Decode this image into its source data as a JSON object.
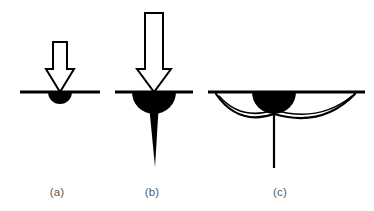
{
  "figure": {
    "background_color": "#ffffff",
    "ink_color": "#000000",
    "caption_color": "#58595b",
    "surface_line_label": "specimen-surface",
    "panel_count": 3
  },
  "panels": [
    {
      "id": "a",
      "caption": "(a)",
      "caption_x": 57,
      "caption_y": 196,
      "description": "Small indenter load producing a shallow plastic deformation zone",
      "surface_line": {
        "x1": 20,
        "x2": 100,
        "y": 92,
        "thickness": 3
      },
      "arrow": {
        "name": "load-arrow",
        "center_x": 60,
        "shaft_top": 42,
        "shaft_bottom": 69,
        "shaft_half_width": 7,
        "head_half_width": 14,
        "tip_y": 92,
        "fill": "#ffffff",
        "stroke": "#000000",
        "stroke_width": 2
      },
      "plastic_zone": {
        "name": "plastic-zone",
        "center_x": 60,
        "center_y": 92,
        "radius": 12,
        "fill": "#000000"
      },
      "crack": null,
      "lateral_arcs": []
    },
    {
      "id": "b",
      "caption": "(b)",
      "caption_x": 152,
      "caption_y": 196,
      "description": "Increased load enlarges plastic zone and nucleates a median/radial crack",
      "surface_line": {
        "x1": 115,
        "x2": 193,
        "y": 92,
        "thickness": 3
      },
      "arrow": {
        "name": "load-arrow",
        "center_x": 154,
        "shaft_top": 13,
        "shaft_bottom": 69,
        "shaft_half_width": 9,
        "head_half_width": 17,
        "tip_y": 92,
        "fill": "#ffffff",
        "stroke": "#000000",
        "stroke_width": 2
      },
      "plastic_zone": {
        "name": "plastic-zone",
        "center_x": 154,
        "center_y": 92,
        "radius": 22,
        "fill": "#000000"
      },
      "crack": {
        "name": "median-crack",
        "top_x": 154,
        "top_y": 110,
        "top_half_width": 4.5,
        "tip_x": 155,
        "tip_y": 167,
        "fill": "#000000"
      },
      "lateral_arcs": []
    },
    {
      "id": "c",
      "caption": "(c)",
      "caption_x": 280,
      "caption_y": 196,
      "description": "Unloading drives lateral cracks outward to the free surface plus residual median crack",
      "surface_line": {
        "x1": 208,
        "x2": 365,
        "y": 92,
        "thickness": 3
      },
      "arrow": null,
      "plastic_zone": {
        "name": "plastic-zone",
        "center_x": 274,
        "center_y": 92,
        "radius": 22,
        "fill": "#000000"
      },
      "crack": {
        "name": "median-crack",
        "top_x": 274,
        "top_y": 114,
        "tip_x": 274,
        "tip_y": 168,
        "stroke_width": 2.2
      },
      "lateral_arcs": [
        {
          "name": "lateral-crack-left",
          "start_x": 216,
          "start_y": 94,
          "control_x": 238,
          "control_y": 126,
          "end_x": 274,
          "end_y": 114,
          "stroke_width": 2.2
        },
        {
          "name": "lateral-crack-right",
          "start_x": 355,
          "start_y": 94,
          "control_x": 322,
          "control_y": 128,
          "end_x": 274,
          "end_y": 114,
          "stroke_width": 2.2
        },
        {
          "name": "lateral-crack-left-inner",
          "start_x": 219,
          "start_y": 96,
          "control_x": 241,
          "control_y": 121,
          "end_x": 274,
          "end_y": 110,
          "stroke_width": 1.6
        },
        {
          "name": "lateral-crack-right-inner",
          "start_x": 352,
          "start_y": 96,
          "control_x": 319,
          "control_y": 123,
          "end_x": 274,
          "end_y": 110,
          "stroke_width": 1.6
        }
      ]
    }
  ]
}
